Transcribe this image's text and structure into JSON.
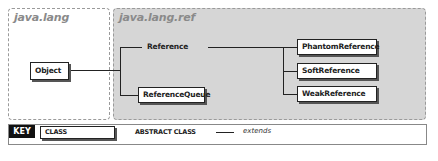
{
  "packages": [
    {
      "name": "java.lang"
    },
    {
      "name": "java.lang.ref"
    }
  ],
  "classes": {
    "object": "Object",
    "reference": "Reference",
    "reference_queue": "ReferenceQueue",
    "phantom_reference": "PhantomReference",
    "soft_reference": "SoftReference",
    "weak_reference": "WeakReference"
  },
  "key": {
    "label": "KEY",
    "class_label": "CLASS",
    "abstract_class_label": "ABSTRACT CLASS",
    "extends_label": "extends"
  },
  "colors": {
    "package_shaded": "#d6d6d6",
    "box_border": "#222222",
    "key_background": "#111111"
  }
}
